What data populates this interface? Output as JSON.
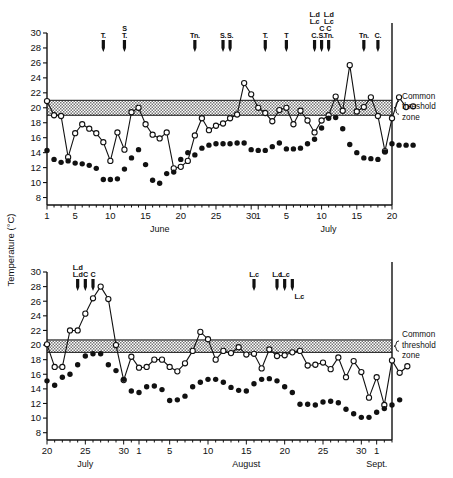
{
  "figure": {
    "y_axis_title": "Temperature (°C)",
    "zone_label_lines": [
      "Common",
      "threshold",
      "zone"
    ]
  },
  "chart_data": [
    {
      "id": "panel-top",
      "type": "line",
      "title": "",
      "xlabel": "",
      "ylabel": "Temperature (°C)",
      "ylim": [
        7,
        30
      ],
      "yticks": [
        8,
        10,
        12,
        14,
        16,
        18,
        20,
        22,
        24,
        26,
        28,
        30
      ],
      "ytick_labels": [
        "8",
        "10",
        "12",
        "14",
        "16",
        "18",
        "20",
        "22",
        "24",
        "26",
        "28",
        "30"
      ],
      "grid": false,
      "legend": "none",
      "month_labels": [
        {
          "text": "June",
          "index": 16
        },
        {
          "text": "July",
          "index": 40
        }
      ],
      "x": [
        "1",
        "2",
        "3",
        "4",
        "5",
        "6",
        "7",
        "8",
        "9",
        "10",
        "11",
        "12",
        "13",
        "14",
        "15",
        "16",
        "17",
        "18",
        "19",
        "20",
        "21",
        "22",
        "23",
        "24",
        "25",
        "26",
        "27",
        "28",
        "29",
        "30",
        "1",
        "2",
        "3",
        "4",
        "5",
        "6",
        "7",
        "8",
        "9",
        "10",
        "11",
        "12",
        "13",
        "14",
        "15",
        "16",
        "17",
        "18",
        "19",
        "20"
      ],
      "xtick_majors": [
        {
          "index": 0,
          "label": "1"
        },
        {
          "index": 4,
          "label": "5"
        },
        {
          "index": 9,
          "label": "10"
        },
        {
          "index": 14,
          "label": "15"
        },
        {
          "index": 19,
          "label": "20"
        },
        {
          "index": 24,
          "label": "25"
        },
        {
          "index": 29,
          "label": "30"
        },
        {
          "index": 30,
          "label": "1"
        },
        {
          "index": 34,
          "label": "5"
        },
        {
          "index": 39,
          "label": "10"
        },
        {
          "index": 44,
          "label": "15"
        },
        {
          "index": 49,
          "label": "20"
        }
      ],
      "threshold_zone": {
        "low": 19.0,
        "high": 21.0
      },
      "series": [
        {
          "name": "surface-temperature-open-circles",
          "marker": "open-circle",
          "connected": true,
          "values": [
            20.9,
            19.0,
            18.9,
            13.4,
            16.6,
            17.8,
            17.2,
            16.6,
            15.4,
            12.9,
            16.7,
            14.4,
            19.4,
            20.0,
            17.8,
            16.4,
            15.9,
            16.7,
            11.9,
            12.1,
            12.9,
            16.3,
            18.6,
            17.0,
            17.6,
            17.9,
            18.6,
            19.1,
            23.3,
            21.8,
            20.0,
            19.3,
            18.2,
            19.7,
            20.0,
            17.8,
            19.6,
            18.3,
            16.7,
            18.3,
            19.0,
            21.5,
            19.6,
            25.7,
            19.5,
            20.1,
            21.4,
            18.9,
            14.2,
            18.6,
            21.4,
            20.1,
            20.2
          ]
        },
        {
          "name": "bottom-temperature-filled-circles",
          "marker": "filled-circle",
          "connected": false,
          "values": [
            14.3,
            13.1,
            12.7,
            12.9,
            12.6,
            12.5,
            12.3,
            11.9,
            10.4,
            10.4,
            10.5,
            11.8,
            13.3,
            14.4,
            12.4,
            10.3,
            9.9,
            11.2,
            11.4,
            13.1,
            14.0,
            13.7,
            14.6,
            15.0,
            15.2,
            15.2,
            15.2,
            15.3,
            15.3,
            14.4,
            14.3,
            14.3,
            14.8,
            15.3,
            14.5,
            14.5,
            14.6,
            15.2,
            15.8,
            17.3,
            18.6,
            18.7,
            17.2,
            15.1,
            14.0,
            13.3,
            13.2,
            13.1,
            14.1,
            15.2,
            15.0,
            15.0,
            15.0
          ]
        }
      ],
      "event_markers": [
        {
          "index": 8,
          "labels_above": [
            "T."
          ],
          "labels_below": []
        },
        {
          "index": 11,
          "labels_above": [
            "S",
            "T."
          ],
          "labels_below": []
        },
        {
          "index": 21,
          "labels_above": [
            "Tn."
          ],
          "labels_below": []
        },
        {
          "index": 25,
          "labels_above": [
            "S."
          ],
          "labels_below": []
        },
        {
          "index": 26,
          "labels_above": [
            "S."
          ],
          "labels_below": []
        },
        {
          "index": 31,
          "labels_above": [
            "T."
          ],
          "labels_below": []
        },
        {
          "index": 34,
          "labels_above": [
            "T"
          ],
          "labels_below": []
        },
        {
          "index": 38,
          "labels_above": [
            "L.d",
            "L.c",
            "",
            "C."
          ],
          "labels_below": []
        },
        {
          "index": 39,
          "labels_above": [
            "",
            "",
            "C",
            "S."
          ],
          "labels_below": []
        },
        {
          "index": 40,
          "labels_above": [
            "L.d",
            "L.c",
            "C",
            "Tn."
          ],
          "labels_below": []
        },
        {
          "index": 45,
          "labels_above": [
            "Tn."
          ],
          "labels_below": []
        },
        {
          "index": 47,
          "labels_above": [
            "C."
          ],
          "labels_below": []
        }
      ]
    },
    {
      "id": "panel-bottom",
      "type": "line",
      "title": "",
      "xlabel": "",
      "ylabel": "Temperature (°C)",
      "ylim": [
        7,
        30
      ],
      "yticks": [
        8,
        10,
        12,
        14,
        16,
        18,
        20,
        22,
        24,
        26,
        28,
        30
      ],
      "ytick_labels": [
        "8",
        "10",
        "12",
        "14",
        "16",
        "18",
        "20",
        "22",
        "24",
        "26",
        "28",
        "30"
      ],
      "grid": false,
      "legend": "none",
      "month_labels": [
        {
          "text": "July",
          "index": 5
        },
        {
          "text": "August",
          "index": 26
        },
        {
          "text": "Sept.",
          "index": 43
        }
      ],
      "x": [
        "20",
        "21",
        "22",
        "23",
        "24",
        "25",
        "26",
        "27",
        "28",
        "29",
        "30",
        "31",
        "1",
        "2",
        "3",
        "4",
        "5",
        "6",
        "7",
        "8",
        "9",
        "10",
        "11",
        "12",
        "13",
        "14",
        "15",
        "16",
        "17",
        "18",
        "19",
        "20",
        "21",
        "22",
        "23",
        "24",
        "25",
        "26",
        "27",
        "28",
        "29",
        "30",
        "31",
        "1",
        "2",
        "3"
      ],
      "xtick_majors": [
        {
          "index": 0,
          "label": "20"
        },
        {
          "index": 5,
          "label": "25"
        },
        {
          "index": 10,
          "label": "30"
        },
        {
          "index": 12,
          "label": "1"
        },
        {
          "index": 16,
          "label": "5"
        },
        {
          "index": 21,
          "label": "10"
        },
        {
          "index": 26,
          "label": "15"
        },
        {
          "index": 31,
          "label": "20"
        },
        {
          "index": 36,
          "label": "25"
        },
        {
          "index": 41,
          "label": "30"
        },
        {
          "index": 43,
          "label": "1"
        }
      ],
      "threshold_zone": {
        "low": 19.0,
        "high": 20.7
      },
      "series": [
        {
          "name": "surface-temperature-open-circles",
          "marker": "open-circle",
          "connected": true,
          "values": [
            20.1,
            17.0,
            17.0,
            22.0,
            22.0,
            24.3,
            26.4,
            28.0,
            26.3,
            20.0,
            15.2,
            18.4,
            16.9,
            17.0,
            18.0,
            18.0,
            17.0,
            16.4,
            17.5,
            19.2,
            21.8,
            20.8,
            18.0,
            19.2,
            18.9,
            19.7,
            18.7,
            18.8,
            16.8,
            19.4,
            18.5,
            18.6,
            19.0,
            19.2,
            17.2,
            17.3,
            17.6,
            16.7,
            18.3,
            15.6,
            17.8,
            16.3,
            12.8,
            15.6,
            11.8,
            17.9,
            16.2,
            17.1
          ]
        },
        {
          "name": "bottom-temperature-filled-circles",
          "marker": "filled-circle",
          "connected": false,
          "values": [
            15.1,
            14.5,
            15.6,
            16.0,
            17.3,
            18.5,
            18.8,
            18.8,
            17.3,
            16.5,
            15.3,
            13.7,
            13.5,
            14.3,
            14.4,
            13.9,
            12.4,
            12.5,
            13.0,
            14.3,
            14.9,
            15.3,
            15.3,
            14.9,
            14.2,
            13.8,
            13.7,
            14.7,
            15.3,
            15.4,
            15.1,
            14.3,
            13.5,
            11.9,
            11.9,
            11.8,
            12.2,
            12.3,
            12.1,
            11.2,
            10.6,
            10.1,
            10.1,
            10.8,
            11.3,
            11.8,
            12.5
          ]
        }
      ],
      "event_markers": [
        {
          "index": 4,
          "labels_above": [
            "L.d",
            "L.d"
          ],
          "labels_below": []
        },
        {
          "index": 5,
          "labels_above": [
            "",
            "C"
          ],
          "labels_below": []
        },
        {
          "index": 6,
          "labels_above": [
            "",
            "C"
          ],
          "labels_below": []
        },
        {
          "index": 27,
          "labels_above": [
            "L.c"
          ],
          "labels_below": []
        },
        {
          "index": 30,
          "labels_above": [
            "L.c"
          ],
          "labels_below": []
        },
        {
          "index": 31,
          "labels_above": [
            "L.c"
          ],
          "labels_below": []
        },
        {
          "index": 32,
          "labels_above": [],
          "labels_below": [
            "L.c"
          ]
        }
      ]
    }
  ]
}
